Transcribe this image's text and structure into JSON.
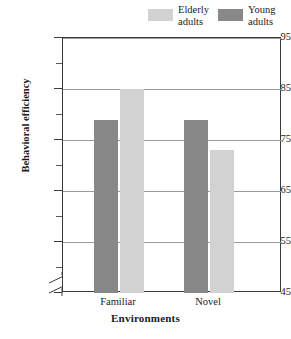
{
  "chart_data": {
    "type": "bar",
    "title": "",
    "xlabel": "Environments",
    "ylabel": "Behavioral efficiency",
    "categories": [
      "Familiar",
      "Novel"
    ],
    "series": [
      {
        "name": "Young adults",
        "color": "#888888",
        "values": [
          79,
          79
        ]
      },
      {
        "name": "Elderly adults",
        "color": "#d2d2d2",
        "values": [
          85,
          73
        ]
      }
    ],
    "ylim": [
      45,
      95
    ],
    "y_major_ticks": [
      95,
      85,
      75,
      65,
      55,
      45
    ],
    "y_minor_ticks": [
      90,
      80,
      70,
      60,
      50
    ],
    "y_tick_labels": [
      "95",
      "85",
      "75",
      "65",
      "55",
      "45"
    ],
    "grid": true,
    "y_axis_break": true,
    "legend_position": "top-right",
    "bar_order_within_group": [
      "Young adults",
      "Elderly adults"
    ]
  },
  "legend": {
    "items": [
      {
        "label_line1": "Elderly",
        "label_line2": "adults",
        "swatch": "light-gray-swatch"
      },
      {
        "label_line1": "Young",
        "label_line2": "adults",
        "swatch": "dark-gray-swatch"
      }
    ]
  },
  "axes": {
    "y_title": "Behavioral efficiency",
    "x_title": "Environments",
    "y_labels": [
      "95",
      "85",
      "75",
      "65",
      "55",
      "45"
    ],
    "x_labels": [
      "Familiar",
      "Novel"
    ]
  },
  "colors": {
    "dark_gray": "#888888",
    "light_gray": "#d2d2d2",
    "frame": "#3a3a3a",
    "gridline": "#9a9a9a",
    "background": "#ffffff"
  }
}
